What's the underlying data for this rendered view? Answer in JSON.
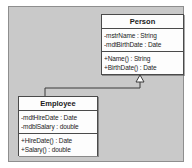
{
  "diagram": {
    "type": "uml-class-diagram",
    "canvas_color": "#c9c9c9",
    "canvas_border_color": "#8e8e8e",
    "box_fill_color": "#fdfdfd",
    "box_border_color": "#4a4a4a",
    "line_color": "#3a3a3a",
    "classes": [
      {
        "id": "person",
        "name": "Person",
        "attributes": [
          "-mstrName : String",
          "-mdtBirthDate : Date"
        ],
        "operations": [
          "+Name() : String",
          "+BirthDate() : Date"
        ]
      },
      {
        "id": "employee",
        "name": "Employee",
        "attributes": [
          "-mdtHireDate : Date",
          "-mdblSalary : double"
        ],
        "operations": [
          "+HireDate() : Date",
          "+Salary() : double"
        ]
      }
    ],
    "relationships": [
      {
        "kind": "generalization",
        "source": "Employee",
        "target": "Person",
        "arrowhead": "hollow-triangle"
      }
    ]
  }
}
